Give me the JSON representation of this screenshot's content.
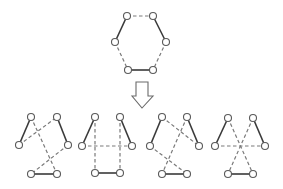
{
  "diagram": {
    "colors": {
      "solid_edge": "#3a3a3a",
      "dashed_edge": "#7a7a7a",
      "node_stroke": "#5a5a5a",
      "node_fill": "#ffffff",
      "background": "#ffffff"
    },
    "node_radius": 3.5,
    "top_graph": {
      "nodes": [
        [
          127,
          16
        ],
        [
          153,
          16
        ],
        [
          115,
          42
        ],
        [
          166,
          42
        ],
        [
          128,
          70
        ],
        [
          153,
          70
        ]
      ],
      "solid_edges": [
        [
          0,
          2
        ],
        [
          1,
          3
        ],
        [
          4,
          5
        ]
      ],
      "dashed_edges": [
        [
          0,
          1
        ],
        [
          2,
          4
        ],
        [
          3,
          5
        ]
      ]
    },
    "arrow": {
      "direction": "down",
      "points": "136,82 148,82 148,96 153,96 142,108 132,96 136,96"
    },
    "bottom_graphs": [
      {
        "nodes": [
          [
            31,
            117
          ],
          [
            57,
            117
          ],
          [
            19,
            145
          ],
          [
            68,
            145
          ],
          [
            31,
            174
          ],
          [
            57,
            174
          ]
        ],
        "solid_edges": [
          [
            0,
            2
          ],
          [
            1,
            3
          ],
          [
            4,
            5
          ]
        ],
        "dashed_edges": [
          [
            2,
            1
          ],
          [
            0,
            5
          ],
          [
            3,
            4
          ]
        ]
      },
      {
        "nodes": [
          [
            95,
            117
          ],
          [
            120,
            117
          ],
          [
            82,
            146
          ],
          [
            132,
            146
          ],
          [
            95,
            173
          ],
          [
            120,
            173
          ]
        ],
        "solid_edges": [
          [
            0,
            2
          ],
          [
            1,
            3
          ],
          [
            4,
            5
          ]
        ],
        "dashed_edges": [
          [
            2,
            3
          ],
          [
            0,
            4
          ],
          [
            1,
            5
          ]
        ]
      },
      {
        "nodes": [
          [
            162,
            117
          ],
          [
            187,
            117
          ],
          [
            150,
            146
          ],
          [
            199,
            146
          ],
          [
            162,
            174
          ],
          [
            187,
            174
          ]
        ],
        "solid_edges": [
          [
            0,
            2
          ],
          [
            1,
            3
          ],
          [
            4,
            5
          ]
        ],
        "dashed_edges": [
          [
            0,
            3
          ],
          [
            1,
            4
          ],
          [
            2,
            5
          ]
        ]
      },
      {
        "nodes": [
          [
            228,
            118
          ],
          [
            253,
            118
          ],
          [
            215,
            146
          ],
          [
            265,
            146
          ],
          [
            228,
            174
          ],
          [
            253,
            174
          ]
        ],
        "solid_edges": [
          [
            0,
            2
          ],
          [
            1,
            3
          ],
          [
            4,
            5
          ]
        ],
        "dashed_edges": [
          [
            2,
            3
          ],
          [
            0,
            5
          ],
          [
            1,
            4
          ]
        ]
      }
    ]
  }
}
